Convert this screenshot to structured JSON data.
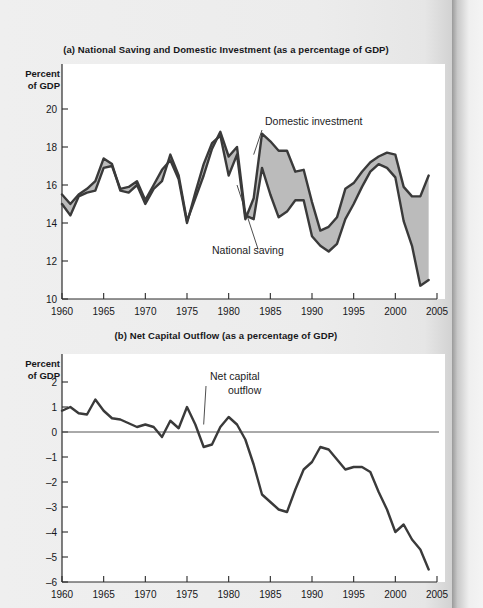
{
  "figure": {
    "panel_a_title": "(a) National Saving and Domestic Investment (as a percentage of GDP)",
    "panel_b_title": "(b) Net Capital Outflow (as a percentage of GDP)",
    "axis_caption_line1": "Percent",
    "axis_caption_line2": "of GDP",
    "band_color": "#b7b7b7",
    "line_color": "#3a3a3a"
  },
  "chart_data": [
    {
      "type": "area",
      "id": "panel-a",
      "title": "(a) National Saving and Domestic Investment (as a percentage of GDP)",
      "xlabel": "",
      "ylabel": "Percent of GDP",
      "xlim": [
        1960,
        2005
      ],
      "ylim": [
        10,
        20
      ],
      "yticks": [
        10,
        12,
        14,
        16,
        18,
        20
      ],
      "xticks": [
        1960,
        1965,
        1970,
        1975,
        1980,
        1985,
        1990,
        1995,
        2000,
        2005
      ],
      "grid": false,
      "legend_position": "inline-annotations",
      "annotations": [
        {
          "text": "Domestic investment",
          "target_year": 1983,
          "target_value": 17.6
        },
        {
          "text": "National saving",
          "target_year": 1981,
          "target_value": 16.0
        }
      ],
      "x": [
        1960,
        1961,
        1962,
        1963,
        1964,
        1965,
        1966,
        1967,
        1968,
        1969,
        1970,
        1971,
        1972,
        1973,
        1974,
        1975,
        1976,
        1977,
        1978,
        1979,
        1980,
        1981,
        1982,
        1983,
        1984,
        1985,
        1986,
        1987,
        1988,
        1989,
        1990,
        1991,
        1992,
        1993,
        1994,
        1995,
        1996,
        1997,
        1998,
        1999,
        2000,
        2001,
        2002,
        2003,
        2004
      ],
      "series": [
        {
          "name": "Domestic investment",
          "values": [
            15.0,
            14.4,
            15.4,
            15.6,
            15.7,
            16.9,
            17.0,
            15.8,
            15.9,
            16.2,
            15.2,
            16.0,
            16.8,
            17.3,
            16.3,
            14.0,
            15.6,
            17.1,
            18.2,
            18.6,
            16.5,
            17.6,
            14.2,
            15.3,
            18.7,
            18.3,
            17.8,
            17.8,
            16.7,
            16.8,
            15.1,
            13.6,
            13.8,
            14.3,
            15.8,
            16.1,
            16.7,
            17.2,
            17.5,
            17.7,
            17.6,
            15.9,
            15.4,
            15.4,
            16.5
          ]
        },
        {
          "name": "National saving",
          "values": [
            15.5,
            15.0,
            15.5,
            15.8,
            16.2,
            17.4,
            17.1,
            15.7,
            15.6,
            16.0,
            15.0,
            15.8,
            16.2,
            17.6,
            16.5,
            14.1,
            15.3,
            16.5,
            17.9,
            18.8,
            17.5,
            18.0,
            14.4,
            14.2,
            16.9,
            15.5,
            14.3,
            14.6,
            15.2,
            15.2,
            13.3,
            12.8,
            12.5,
            12.9,
            14.2,
            15.0,
            15.9,
            16.7,
            17.1,
            16.9,
            16.4,
            14.1,
            12.8,
            10.7,
            11.0
          ]
        }
      ]
    },
    {
      "type": "line",
      "id": "panel-b",
      "title": "(b) Net Capital Outflow (as a percentage of GDP)",
      "xlabel": "",
      "ylabel": "Percent of GDP",
      "xlim": [
        1960,
        2005
      ],
      "ylim": [
        -6,
        2
      ],
      "yticks": [
        2,
        1,
        0,
        -1,
        -2,
        -3,
        -4,
        -5,
        -6
      ],
      "xticks": [
        1960,
        1965,
        1970,
        1975,
        1980,
        1985,
        1990,
        1995,
        2000,
        2005
      ],
      "grid": false,
      "zero_line": true,
      "annotations": [
        {
          "text_line1": "Net capital",
          "text_line2": "outflow",
          "target_year": 1977,
          "target_value": 0.3
        }
      ],
      "x": [
        1960,
        1961,
        1962,
        1963,
        1964,
        1965,
        1966,
        1967,
        1968,
        1969,
        1970,
        1971,
        1972,
        1973,
        1974,
        1975,
        1976,
        1977,
        1978,
        1979,
        1980,
        1981,
        1982,
        1983,
        1984,
        1985,
        1986,
        1987,
        1988,
        1989,
        1990,
        1991,
        1992,
        1993,
        1994,
        1995,
        1996,
        1997,
        1998,
        1999,
        2000,
        2001,
        2002,
        2003,
        2004
      ],
      "series": [
        {
          "name": "Net capital outflow",
          "values": [
            0.85,
            1.0,
            0.75,
            0.7,
            1.3,
            0.85,
            0.55,
            0.5,
            0.35,
            0.2,
            0.3,
            0.2,
            -0.2,
            0.45,
            0.15,
            1.0,
            0.3,
            -0.6,
            -0.5,
            0.2,
            0.6,
            0.3,
            -0.3,
            -1.3,
            -2.5,
            -2.8,
            -3.1,
            -3.2,
            -2.3,
            -1.5,
            -1.2,
            -0.6,
            -0.7,
            -1.1,
            -1.5,
            -1.4,
            -1.4,
            -1.6,
            -2.4,
            -3.1,
            -4.0,
            -3.7,
            -4.3,
            -4.7,
            -5.5
          ]
        }
      ]
    }
  ]
}
